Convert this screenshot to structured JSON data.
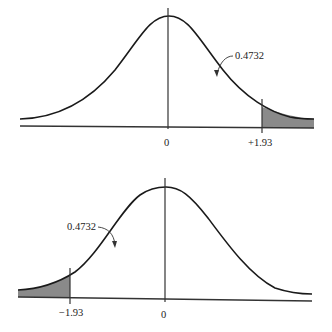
{
  "figures": [
    {
      "name": "right-tail-normal",
      "center_label": "0",
      "cut_label": "+1.93",
      "area_label": "0.4732",
      "shaded_tail": "right"
    },
    {
      "name": "left-tail-normal",
      "center_label": "0",
      "cut_label": "−1.93",
      "area_label": "0.4732",
      "shaded_tail": "left"
    }
  ],
  "colors": {
    "curve": "#1a1a1a",
    "shade": "#8a8a8a",
    "axis": "#333333"
  }
}
